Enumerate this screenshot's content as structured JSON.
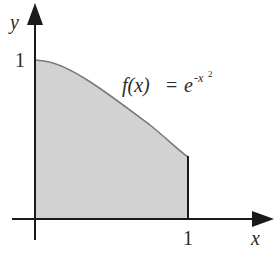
{
  "figure": {
    "y_axis_label": "y",
    "x_axis_label": "x",
    "y_tick": "1",
    "x_tick": "1",
    "formula": {
      "lhs": "f(x)",
      "eq": "=",
      "base": "e",
      "exponent": "-x",
      "exponent_power": "2"
    }
  },
  "colors": {
    "axis": "#1a1a1a",
    "fill": "#d2d2d2",
    "curve": "#7a7a7a"
  }
}
